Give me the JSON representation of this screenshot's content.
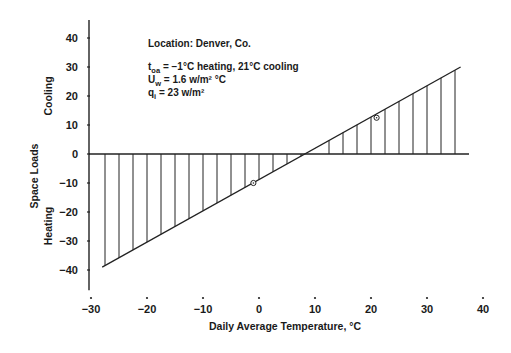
{
  "chart_data": {
    "type": "line",
    "title": "",
    "xlabel": "Daily Average Temperature, °C",
    "ylabel": "Space Loads",
    "y_region_labels": {
      "upper": "Cooling",
      "lower": "Heating"
    },
    "xlim": [
      -30,
      40
    ],
    "ylim": [
      -40,
      40
    ],
    "x_ticks": [
      -30,
      -20,
      -10,
      0,
      10,
      20,
      30,
      40
    ],
    "x_tick_labels": [
      "−30",
      "−20",
      "−10",
      "0",
      "10",
      "20",
      "30",
      "40"
    ],
    "y_ticks": [
      40,
      30,
      20,
      10,
      0,
      -10,
      -20,
      -30,
      -40
    ],
    "y_tick_labels": [
      "40",
      "30",
      "20",
      "10",
      "0",
      "−10",
      "−20",
      "−30",
      "−40"
    ],
    "grid": false,
    "series": [
      {
        "name": "Space load line",
        "x": [
          -28,
          36
        ],
        "y": [
          -39,
          30
        ]
      }
    ],
    "hatch_x": [
      -27.5,
      -25,
      -22.5,
      -20,
      -17.5,
      -15,
      -12.5,
      -10,
      -7.5,
      -5,
      -2.5,
      0,
      2.5,
      5,
      7.5,
      12.5,
      15,
      17.5,
      20,
      22.5,
      25,
      27.5,
      30,
      32.5,
      35
    ],
    "markers": [
      {
        "x": -1,
        "y": -10,
        "label": "heating balance point"
      },
      {
        "x": 21,
        "y": 12.5,
        "label": "cooling balance point"
      }
    ],
    "zero_crossing_x": 9,
    "annotations": {
      "location": "Location:  Denver, Co.",
      "toa_symbol": "t",
      "toa_sub": "oa",
      "toa_text": " = −1°C heating, 21°C cooling",
      "uw_symbol": "U",
      "uw_sub": "w",
      "uw_text": " = 1.6 w/m² °C",
      "qi_symbol": "q",
      "qi_sub": "i",
      "qi_text": "   = 23 w/m²"
    }
  }
}
